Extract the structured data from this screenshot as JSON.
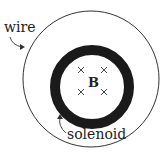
{
  "labels": {
    "wire": "wire",
    "solenoid": "solenoid",
    "field": "B"
  },
  "field_markers": {
    "symbol": "×",
    "count": 4,
    "direction": "into-page"
  },
  "colors": {
    "ink": "#222222",
    "background": "#ffffff"
  }
}
